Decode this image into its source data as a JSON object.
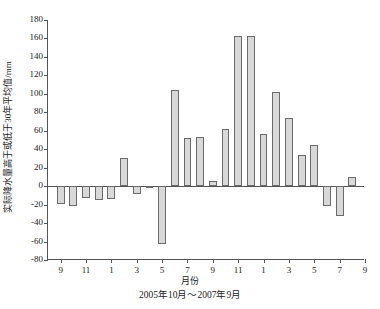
{
  "chart_data": {
    "type": "bar",
    "title": "",
    "xlabel": "月份",
    "ylabel": "实际降水量高于或低于30年平均值/mm",
    "caption": "2005年10月～2007年9月",
    "ylim": [
      -80,
      180
    ],
    "yticks": [
      -80,
      -60,
      -40,
      -20,
      0,
      20,
      40,
      60,
      80,
      100,
      120,
      140,
      160,
      180
    ],
    "ytick_labels": [
      "-80",
      "-60",
      "-40",
      "-20",
      "0",
      "20",
      "40",
      "60",
      "80",
      "100",
      "120",
      "140",
      "160",
      "180"
    ],
    "xlim": [
      0,
      25
    ],
    "xticks": [
      1,
      3,
      5,
      7,
      9,
      11,
      13,
      15,
      17,
      19,
      21,
      23,
      25
    ],
    "xtick_labels": [
      "9",
      "11",
      "1",
      "3",
      "5",
      "7",
      "9",
      "11",
      "1",
      "3",
      "5",
      "7",
      "9"
    ],
    "grid": false,
    "legend": "none",
    "bar_color": "#d8d8d8",
    "bar_edge_color": "#6a6a6a",
    "axis_color": "#555555",
    "categories": [
      "10",
      "11",
      "12",
      "1",
      "2",
      "3",
      "4",
      "5",
      "6",
      "7",
      "8",
      "9",
      "10",
      "11",
      "12",
      "1",
      "2",
      "3",
      "4",
      "5",
      "6",
      "7",
      "8",
      "9"
    ],
    "values": [
      -19,
      -22,
      -13,
      -15,
      -14,
      31,
      -9,
      -2,
      -63,
      104,
      52,
      53,
      6,
      62,
      163,
      163,
      57,
      102,
      74,
      34,
      45,
      -21,
      -32,
      10
    ]
  }
}
